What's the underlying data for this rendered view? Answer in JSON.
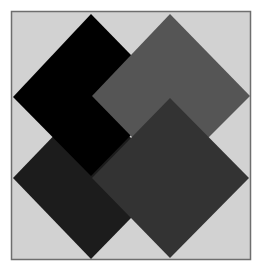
{
  "figure": {
    "background": "#ffffff",
    "frame": {
      "x": 11,
      "y": 11,
      "width": 239,
      "height": 248,
      "fill": "#d2d2d2",
      "stroke": "#6e6e6e"
    },
    "diamonds": [
      {
        "name": "bottom-left-diamond",
        "fill": "#1c1c1c",
        "points": "91,97 170,178 91,259 13,178"
      },
      {
        "name": "top-left-diamond",
        "fill": "#000000",
        "points": "91,14 170,95 91,176 13,97"
      },
      {
        "name": "top-right-diamond",
        "fill": "#555555",
        "points": "170,14 250,96 170,176 92,96"
      },
      {
        "name": "bottom-right-diamond",
        "fill": "#333333",
        "points": "170,98 249,178 170,258 92,178"
      }
    ]
  }
}
